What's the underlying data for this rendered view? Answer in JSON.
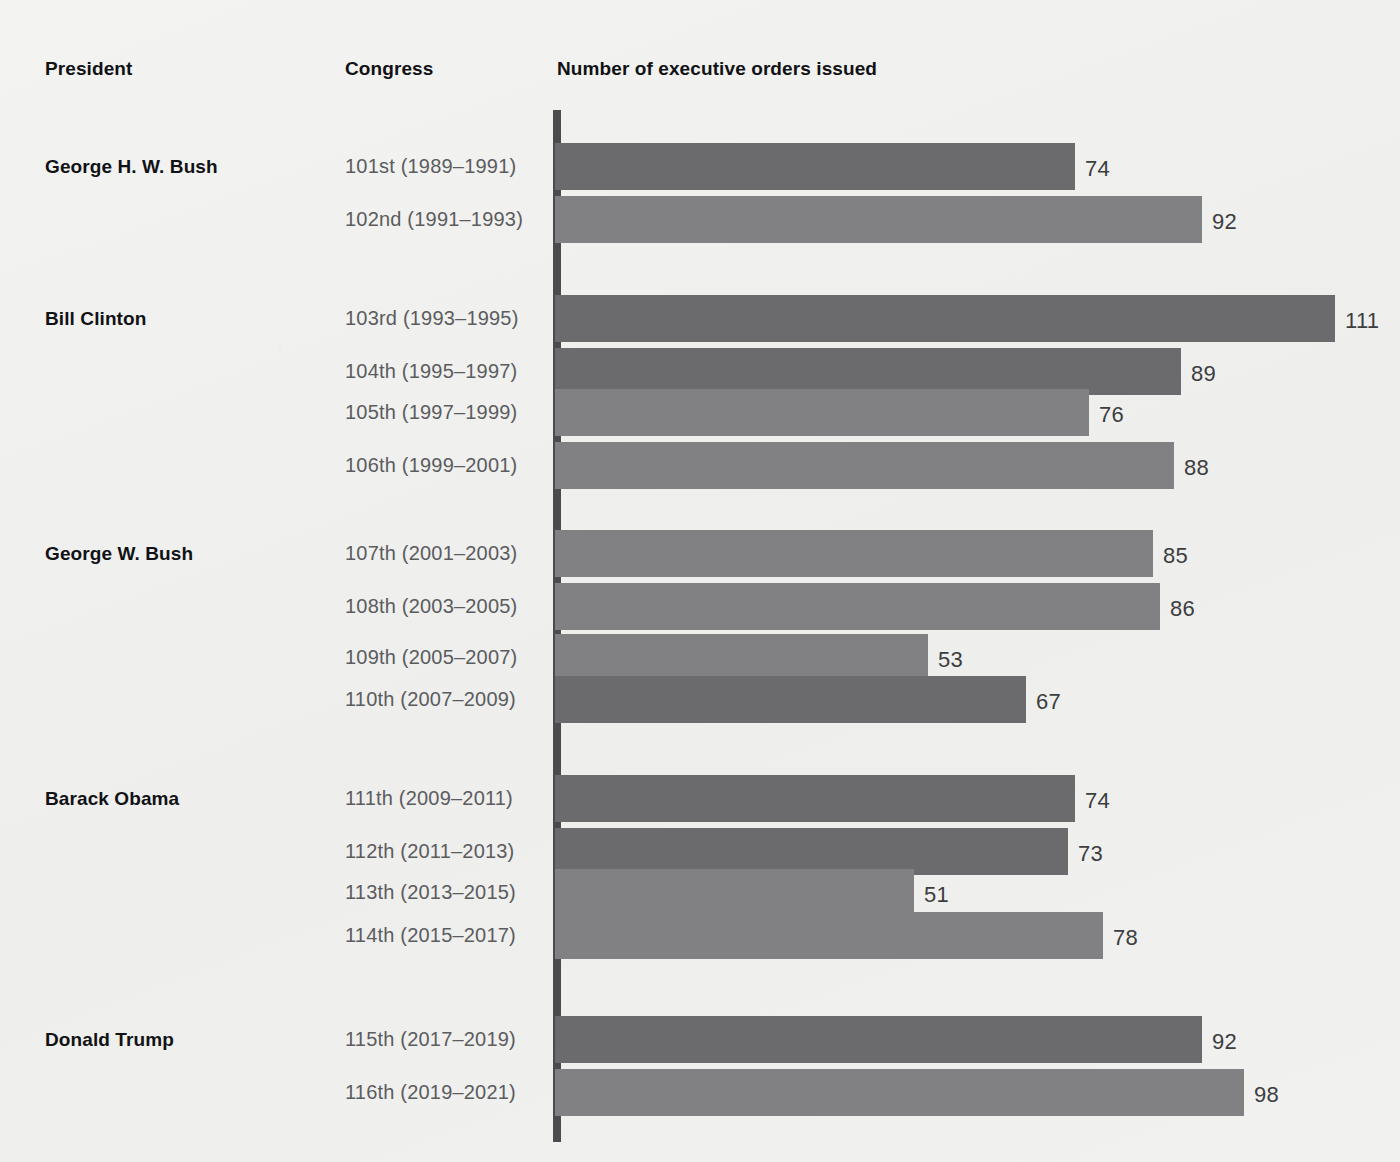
{
  "headers": {
    "president": "President",
    "congress": "Congress",
    "values": "Number of executive orders issued"
  },
  "style": {
    "bar_dark": "#6b6b6d",
    "bar_light": "#818183",
    "axis": "#4b4b4d",
    "background": "#f1f1f0",
    "label_color": "#5b5c5e",
    "value_color": "#3c3d3f"
  },
  "chart_data": {
    "type": "bar",
    "orientation": "horizontal",
    "title": "Number of executive orders issued",
    "xlabel": "Number of executive orders issued",
    "ylabel": "Congress",
    "xlim": [
      0,
      111
    ],
    "grid": false,
    "legend": "none",
    "categories": [
      "101st (1989–1991)",
      "102nd (1991–1993)",
      "103rd (1993–1995)",
      "104th (1995–1997)",
      "105th (1997–1999)",
      "106th (1999–2001)",
      "107th (2001–2003)",
      "108th (2003–2005)",
      "109th (2005–2007)",
      "110th (2007–2009)",
      "111th (2009–2011)",
      "112th (2011–2013)",
      "113th (2013–2015)",
      "114th (2015–2017)",
      "115th (2017–2019)",
      "116th (2019–2021)"
    ],
    "values": [
      74,
      92,
      111,
      89,
      76,
      88,
      85,
      86,
      53,
      67,
      74,
      73,
      51,
      78,
      92,
      98
    ],
    "groups": [
      {
        "president": "George H. W. Bush",
        "congresses": [
          "101st (1989–1991)",
          "102nd (1991–1993)"
        ],
        "values": [
          74,
          92
        ]
      },
      {
        "president": "Bill Clinton",
        "congresses": [
          "103rd (1993–1995)",
          "104th (1995–1997)",
          "105th (1997–1999)",
          "106th (1999–2001)"
        ],
        "values": [
          111,
          89,
          76,
          88
        ]
      },
      {
        "president": "George W. Bush",
        "congresses": [
          "107th (2001–2003)",
          "108th (2003–2005)",
          "109th (2005–2007)",
          "110th (2007–2009)"
        ],
        "values": [
          85,
          86,
          53,
          67
        ]
      },
      {
        "president": "Barack Obama",
        "congresses": [
          "111th (2009–2011)",
          "112th (2011–2013)",
          "113th (2013–2015)",
          "114th (2015–2017)"
        ],
        "values": [
          74,
          73,
          51,
          78
        ]
      },
      {
        "president": "Donald Trump",
        "congresses": [
          "115th (2017–2019)",
          "116th (2019–2021)"
        ],
        "values": [
          92,
          98
        ]
      }
    ]
  },
  "rows": [
    {
      "president": "George H. W. Bush",
      "congress": "101st (1989–1991)",
      "value": 74,
      "value_label": "74",
      "shade": "dark",
      "top": 143
    },
    {
      "president": "",
      "congress": "102nd (1991–1993)",
      "value": 92,
      "value_label": "92",
      "shade": "light",
      "top": 196
    },
    {
      "president": "Bill Clinton",
      "congress": "103rd (1993–1995)",
      "value": 111,
      "value_label": "111",
      "shade": "dark",
      "top": 295
    },
    {
      "president": "",
      "congress": "104th (1995–1997)",
      "value": 89,
      "value_label": "89",
      "shade": "dark",
      "top": 348
    },
    {
      "president": "",
      "congress": "105th (1997–1999)",
      "value": 76,
      "value_label": "76",
      "shade": "light",
      "top": 389
    },
    {
      "president": "",
      "congress": "106th (1999–2001)",
      "value": 88,
      "value_label": "88",
      "shade": "light",
      "top": 442
    },
    {
      "president": "George W. Bush",
      "congress": "107th (2001–2003)",
      "value": 85,
      "value_label": "85",
      "shade": "light",
      "top": 530
    },
    {
      "president": "",
      "congress": "108th (2003–2005)",
      "value": 86,
      "value_label": "86",
      "shade": "light",
      "top": 583
    },
    {
      "president": "",
      "congress": "109th (2005–2007)",
      "value": 53,
      "value_label": "53",
      "shade": "light",
      "top": 634
    },
    {
      "president": "",
      "congress": "110th (2007–2009)",
      "value": 67,
      "value_label": "67",
      "shade": "dark",
      "top": 676
    },
    {
      "president": "Barack Obama",
      "congress": "111th (2009–2011)",
      "value": 74,
      "value_label": "74",
      "shade": "dark",
      "top": 775
    },
    {
      "president": "",
      "congress": "112th (2011–2013)",
      "value": 73,
      "value_label": "73",
      "shade": "dark",
      "top": 828
    },
    {
      "president": "",
      "congress": "113th (2013–2015)",
      "value": 51,
      "value_label": "51",
      "shade": "light",
      "top": 869
    },
    {
      "president": "",
      "congress": "114th (2015–2017)",
      "value": 78,
      "value_label": "78",
      "shade": "light",
      "top": 912
    },
    {
      "president": "Donald Trump",
      "congress": "115th (2017–2019)",
      "value": 92,
      "value_label": "92",
      "shade": "dark",
      "top": 1016
    },
    {
      "president": "",
      "congress": "116th (2019–2021)",
      "value": 98,
      "value_label": "98",
      "shade": "light",
      "top": 1069
    }
  ],
  "geometry": {
    "axis_x": 555,
    "px_per_unit": 7.03,
    "bar_height": 47
  }
}
